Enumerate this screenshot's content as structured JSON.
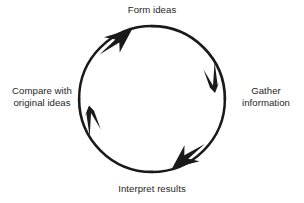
{
  "diagram": {
    "type": "cycle",
    "direction": "clockwise",
    "canvas": {
      "width": 304,
      "height": 203,
      "background": "#ffffff"
    },
    "circle": {
      "cx": 152,
      "cy": 99,
      "r": 73,
      "stroke": "#1a1a1a",
      "stroke_width": 2.6
    },
    "nodes": [
      {
        "id": "form-ideas",
        "position": "top",
        "lines": [
          "Form ideas"
        ],
        "line1": "Form ideas",
        "line2": ""
      },
      {
        "id": "gather-information",
        "position": "right",
        "lines": [
          "Gather",
          "information"
        ],
        "line1": "Gather",
        "line2": "information"
      },
      {
        "id": "interpret-results",
        "position": "bottom",
        "lines": [
          "Interpret results"
        ],
        "line1": "Interpret results",
        "line2": ""
      },
      {
        "id": "compare-original-ideas",
        "position": "left",
        "lines": [
          "Compare with",
          "original ideas"
        ],
        "line1": "Compare with",
        "line2": "original ideas"
      }
    ],
    "arrows": [
      {
        "id": "arrow-to-form-ideas",
        "at_angle_deg": 138,
        "points_toward": "form-ideas",
        "color": "#1a1a1a"
      },
      {
        "id": "arrow-to-gather-information",
        "at_angle_deg": 20,
        "points_toward": "gather-information",
        "color": "#1a1a1a"
      },
      {
        "id": "arrow-to-interpret-results",
        "at_angle_deg": -52,
        "points_toward": "interpret-results",
        "color": "#1a1a1a"
      },
      {
        "id": "arrow-to-compare-original-ideas",
        "at_angle_deg": 198,
        "points_toward": "compare-original-ideas",
        "color": "#1a1a1a"
      }
    ],
    "colors": {
      "stroke": "#1a1a1a",
      "text": "#262626",
      "background": "#ffffff"
    }
  }
}
